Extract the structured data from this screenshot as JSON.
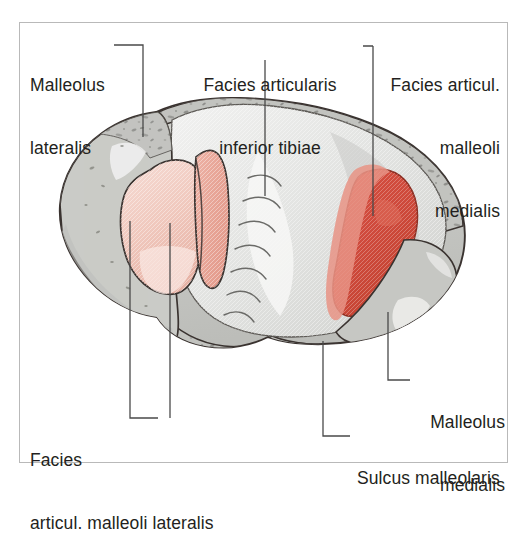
{
  "figure": {
    "type": "anatomical-illustration",
    "frame": {
      "border_color": "#b9b9b9"
    },
    "palette": {
      "bone_outline": "#3a3330",
      "cortical_band": "#b9bab6",
      "cancellous_fill": "#c9cac6",
      "articular_light": "#ececec",
      "articular_mid": "#d2d3d1",
      "pink_light": "#f2cfc6",
      "pink_mid": "#e9a79b",
      "red_deep": "#cf4a3c",
      "red_soft": "#e08478",
      "leader_line": "#4a4a4a",
      "text": "#231f20"
    },
    "labels": [
      {
        "id": "malleolus-lateralis",
        "lines": [
          "Malleolus",
          "lateralis"
        ],
        "align": "left",
        "x": 30,
        "y": 33
      },
      {
        "id": "facies-articularis-inferior-tibiae",
        "lines": [
          "Facies articularis",
          "inferior tibiae"
        ],
        "align": "center",
        "x": 190,
        "y": 33
      },
      {
        "id": "facies-articul-malleoli-medialis",
        "lines": [
          "Facies articul.",
          "malleoli",
          "medialis"
        ],
        "align": "right",
        "x": 385,
        "y": 33
      },
      {
        "id": "facies-articul-malleoli-lateralis",
        "lines": [
          "Facies",
          "articul. malleoli lateralis"
        ],
        "align": "left",
        "x": 30,
        "y": 404
      },
      {
        "id": "malleolus-medialis",
        "lines": [
          "Malleolus",
          "medialis"
        ],
        "align": "left",
        "x": 415,
        "y": 373
      },
      {
        "id": "sulcus-malleolaris",
        "lines": [
          "Sulcus malleolaris"
        ],
        "align": "left",
        "x": 355,
        "y": 427
      }
    ],
    "leaders": [
      {
        "id": "leader-malleolus-lateralis",
        "target": "Malleolus lateralis"
      },
      {
        "id": "leader-facies-inferior",
        "target": "Facies articularis inferior tibiae"
      },
      {
        "id": "leader-facies-medialis",
        "target": "Facies articul. malleoli medialis"
      },
      {
        "id": "leader-facies-lateralis-a",
        "target": "Facies articul. malleoli lateralis (anterior)"
      },
      {
        "id": "leader-facies-lateralis-b",
        "target": "Facies articul. malleoli lateralis (posterior)"
      },
      {
        "id": "leader-malleolus-medialis",
        "target": "Malleolus medialis"
      },
      {
        "id": "leader-sulcus-malleolaris",
        "target": "Sulcus malleolaris"
      }
    ],
    "regions": [
      {
        "id": "region-malleolus-lateralis",
        "name": "Malleolus lateralis",
        "color": "#c9cac6"
      },
      {
        "id": "region-facies-inferior",
        "name": "Facies articularis inferior tibiae",
        "color": "#ececec"
      },
      {
        "id": "region-facies-lat-anterior",
        "name": "Facies articul. malleoli lateralis",
        "color": "#f2cfc6"
      },
      {
        "id": "region-facies-lat-posterior",
        "name": "Facies articul. malleoli lateralis",
        "color": "#e9a79b"
      },
      {
        "id": "region-facies-med",
        "name": "Facies articul. malleoli medialis",
        "color": "#cf4a3c"
      },
      {
        "id": "region-malleolus-medialis",
        "name": "Malleolus medialis",
        "color": "#c9cac6"
      },
      {
        "id": "region-sulcus-malleolaris",
        "name": "Sulcus malleolaris",
        "color": "#b9bab6"
      }
    ]
  }
}
